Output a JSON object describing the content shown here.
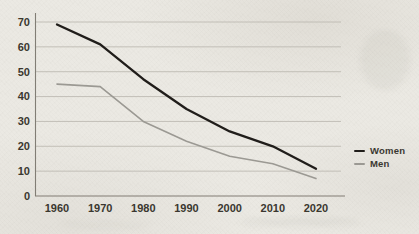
{
  "page": {
    "background_color": "#ebe9e3"
  },
  "chart_data": {
    "type": "line",
    "title": "",
    "xlabel": "",
    "ylabel": "",
    "x": [
      1960,
      1970,
      1980,
      1990,
      2000,
      2010,
      2020
    ],
    "x_tick_labels": [
      "1960",
      "1970",
      "1980",
      "1990",
      "2000",
      "2010",
      "2020"
    ],
    "series": [
      {
        "name": "Women",
        "color": "#201d1a",
        "stroke_width": 2.3,
        "values": [
          69,
          61,
          47,
          35,
          26,
          20,
          11
        ]
      },
      {
        "name": "Men",
        "color": "#9b9993",
        "stroke_width": 1.6,
        "values": [
          45,
          44,
          30,
          22,
          16,
          13,
          7
        ]
      }
    ],
    "ylim": [
      0,
      70
    ],
    "yticks": [
      0,
      10,
      20,
      30,
      40,
      50,
      60,
      70
    ],
    "grid": "horizontal gridlines every 10",
    "legend_position": "right-middle",
    "axis_color": "#817d75",
    "grid_color": "#bdbab2",
    "label_color": "#3a372f"
  }
}
